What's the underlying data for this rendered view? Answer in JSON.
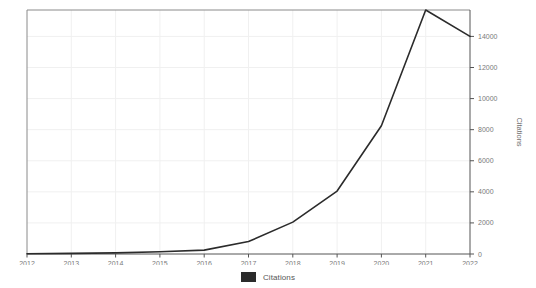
{
  "chart_data": {
    "type": "line",
    "title": "",
    "xlabel": "",
    "ylabel": "Citations",
    "x": [
      2012,
      2013,
      2014,
      2015,
      2016,
      2017,
      2018,
      2019,
      2020,
      2021,
      2022
    ],
    "categories": [
      "2012",
      "2013",
      "2014",
      "2015",
      "2016",
      "2017",
      "2018",
      "2019",
      "2020",
      "2021",
      "2022"
    ],
    "series": [
      {
        "name": "Citations",
        "color": "#2b2b2b",
        "values": [
          20,
          40,
          70,
          140,
          250,
          800,
          2050,
          4050,
          8250,
          15700,
          14000
        ]
      }
    ],
    "xlim": [
      2012,
      2022
    ],
    "ylim": [
      0,
      15700
    ],
    "yticks": [
      0,
      2000,
      4000,
      6000,
      8000,
      10000,
      12000,
      14000
    ],
    "ytick_labels": [
      "0",
      "2000",
      "4000",
      "6000",
      "8000",
      "10000",
      "12000",
      "14000"
    ],
    "xticks": [
      2012,
      2013,
      2014,
      2015,
      2016,
      2017,
      2018,
      2019,
      2020,
      2021,
      2022
    ],
    "xtick_labels": [
      "2012",
      "2013",
      "2014",
      "2015",
      "2016",
      "2017",
      "2018",
      "2019",
      "2020",
      "2021",
      "2022"
    ],
    "y_axis_position": "right",
    "grid": true,
    "grid_color": "#f0f0f0",
    "axis_color": "#555555",
    "legend": {
      "position": "bottom",
      "entries": [
        {
          "label": "Citations",
          "color": "#2b2b2b"
        }
      ]
    }
  },
  "legend": {
    "label": "Citations"
  },
  "axes": {
    "y_title": "Citations"
  }
}
